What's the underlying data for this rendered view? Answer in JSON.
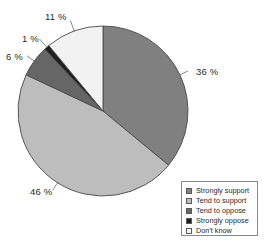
{
  "chart_data": {
    "type": "pie",
    "title": "",
    "subtitle": "",
    "xlabel": "",
    "ylabel": "",
    "grid": false,
    "legend_position": "bottom-right",
    "start_angle_deg": 0,
    "direction": "clockwise",
    "units": "%",
    "categories": [
      "Strongly support",
      "Tend to support",
      "Tend to oppose",
      "Strongly oppose",
      "Don't know"
    ],
    "values": [
      36,
      46,
      6,
      1,
      11
    ],
    "value_labels": [
      "36 %",
      "46 %",
      "6 %",
      "1 %",
      "11 %"
    ],
    "colors": [
      "#808080",
      "#bdbdbd",
      "#666666",
      "#1f1f1f",
      "#f2f2f2"
    ],
    "slices": [
      {
        "label": "Strongly support",
        "value": 36,
        "value_label": "36 %",
        "color": "#808080"
      },
      {
        "label": "Tend to support",
        "value": 46,
        "value_label": "46 %",
        "color": "#bdbdbd"
      },
      {
        "label": "Tend to oppose",
        "value": 6,
        "value_label": "6 %",
        "color": "#666666"
      },
      {
        "label": "Strongly oppose",
        "value": 1,
        "value_label": "1 %",
        "color": "#1f1f1f"
      },
      {
        "label": "Don't know",
        "value": 11,
        "value_label": "11 %",
        "color": "#f2f2f2"
      }
    ]
  },
  "legend": {
    "items": [
      {
        "label": "Strongly support",
        "color": "#808080"
      },
      {
        "label": "Tend to support",
        "color": "#bdbdbd"
      },
      {
        "label": "Tend to oppose",
        "color": "#666666"
      },
      {
        "label": "Strongly oppose",
        "color": "#1f1f1f"
      },
      {
        "label": "Don't know",
        "color": "#f2f2f2"
      }
    ]
  },
  "style": {
    "outline": "#4a4a4a",
    "leader_line": "#6b6b6b",
    "background": "#ffffff",
    "text": "#2b2b2b"
  }
}
